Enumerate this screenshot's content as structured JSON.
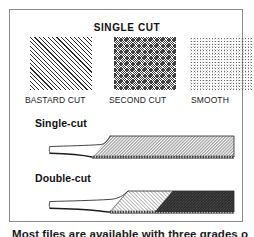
{
  "figure": {
    "title": "SINGLE CUT",
    "swatches": [
      {
        "label": "BASTARD CUT",
        "pattern": "coarse-diagonal-hatch",
        "coarseness": "coarse"
      },
      {
        "label": "SECOND CUT",
        "pattern": "fine-crosshatch",
        "coarseness": "medium"
      },
      {
        "label": "SMOOTH",
        "pattern": "light-stipple",
        "coarseness": "fine"
      }
    ],
    "rows": [
      {
        "heading": "Single-cut",
        "blade_pattern": "single-direction-diagonal-hatch"
      },
      {
        "heading": "Double-cut",
        "blade_pattern": "crossed-double-diagonal-hatch"
      }
    ],
    "caption": "Most files are available with three grades of",
    "colors": {
      "frame": "#8a8a8a",
      "ink": "#111111",
      "hatch_light": "#9a9a9a",
      "hatch_dark": "#3a3a3a",
      "page": "#ffffff"
    }
  }
}
